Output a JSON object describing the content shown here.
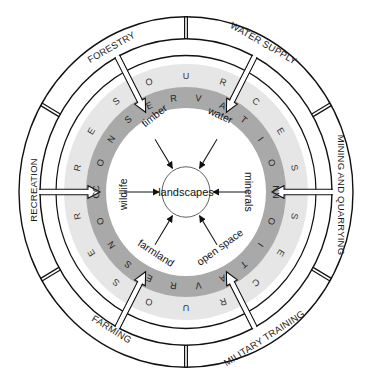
{
  "diagram": {
    "center": {
      "label": "landscapes"
    },
    "resource_ring_text": "RESOURCES",
    "conservation_ring_text": "CONSERVATION",
    "outer_segments": [
      {
        "label": "FORESTRY",
        "angle": -112.5
      },
      {
        "label": "WATER SUPPLY",
        "angle": -67.5
      },
      {
        "label": "MINING AND QUARRYING",
        "angle": 0
      },
      {
        "label": "MILITARY TRAINING",
        "angle": 67.5
      },
      {
        "label": "FARMING",
        "angle": 112.5
      },
      {
        "label": "RECREATION",
        "angle": 180
      }
    ],
    "resources": [
      {
        "label": "timber",
        "from": "FORESTRY"
      },
      {
        "label": "water",
        "from": "WATER SUPPLY"
      },
      {
        "label": "minerals",
        "from": "MINING AND QUARRYING"
      },
      {
        "label": "open space",
        "from": "MILITARY TRAINING"
      },
      {
        "label": "farmland",
        "from": "FARMING"
      },
      {
        "label": "wildlife",
        "from": "RECREATION"
      }
    ],
    "colors": {
      "light_band": "#e6e6e6",
      "dark_band": "#a9a9a9",
      "line": "#111111",
      "background": "#ffffff"
    }
  }
}
